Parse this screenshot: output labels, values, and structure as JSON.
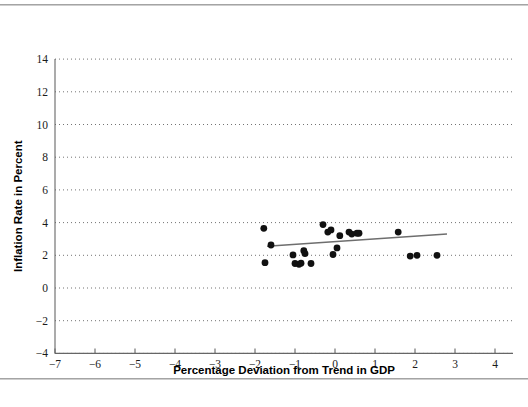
{
  "figure": {
    "name": "inflation-vs-gdp-deviation-scatter",
    "background_color": "#ffffff",
    "point_color": "#111111",
    "trend_color": "#6e6e6e",
    "grid_color": "#5a5a5a",
    "axis_color": "#666666"
  },
  "chart_data": {
    "type": "scatter",
    "title": "",
    "subtitle": "",
    "xlabel": "Percentage Deviation from Trend in GDP",
    "ylabel": "Inflation Rate in Percent",
    "xlim": [
      -7,
      4
    ],
    "ylim": [
      -4,
      14
    ],
    "xticks": [
      -7,
      -6,
      -5,
      -4,
      -3,
      -2,
      -1,
      0,
      1,
      2,
      3,
      4
    ],
    "xticklabels": [
      "−7",
      "−6",
      "−5",
      "−4",
      "−3",
      "−2",
      "−1",
      "0",
      "1",
      "2",
      "3",
      "4"
    ],
    "yticks": [
      -4,
      -2,
      0,
      2,
      4,
      6,
      8,
      10,
      12,
      14
    ],
    "yticklabels": [
      "−4",
      "−2",
      "0",
      "2",
      "4",
      "6",
      "8",
      "10",
      "12",
      "14"
    ],
    "grid": "horizontal-dotted",
    "legend": "none",
    "marker": "filled-circle",
    "marker_size": 4.6,
    "points": [
      {
        "x": -1.78,
        "y": 3.65
      },
      {
        "x": -1.6,
        "y": 2.63
      },
      {
        "x": -1.75,
        "y": 1.55
      },
      {
        "x": -1.05,
        "y": 2.02
      },
      {
        "x": -1.0,
        "y": 1.5
      },
      {
        "x": -0.9,
        "y": 1.45
      },
      {
        "x": -0.85,
        "y": 1.52
      },
      {
        "x": -0.6,
        "y": 1.5
      },
      {
        "x": -0.78,
        "y": 2.28
      },
      {
        "x": -0.75,
        "y": 2.1
      },
      {
        "x": -0.3,
        "y": 3.88
      },
      {
        "x": -0.18,
        "y": 3.42
      },
      {
        "x": -0.1,
        "y": 3.55
      },
      {
        "x": -0.05,
        "y": 2.05
      },
      {
        "x": 0.05,
        "y": 2.45
      },
      {
        "x": 0.12,
        "y": 3.2
      },
      {
        "x": 0.35,
        "y": 3.42
      },
      {
        "x": 0.42,
        "y": 3.3
      },
      {
        "x": 0.55,
        "y": 3.35
      },
      {
        "x": 0.6,
        "y": 3.35
      },
      {
        "x": 1.58,
        "y": 3.42
      },
      {
        "x": 1.88,
        "y": 1.95
      },
      {
        "x": 2.05,
        "y": 2.0
      },
      {
        "x": 2.55,
        "y": 2.0
      }
    ],
    "trend": {
      "label": "fitted-regression-line",
      "x_start": -1.7,
      "y_start": 2.55,
      "x_end": 2.8,
      "y_end": 3.3
    }
  }
}
